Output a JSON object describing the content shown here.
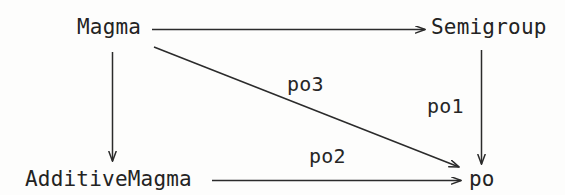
{
  "diagram": {
    "stroke_color": "#2b2b2b",
    "text_color": "#232323",
    "background_color": "#fdfdfc",
    "nodes": [
      {
        "id": "magma",
        "label": "Magma",
        "x": 77,
        "y": 17
      },
      {
        "id": "semigroup",
        "label": "Semigroup",
        "x": 431,
        "y": 17
      },
      {
        "id": "additivemagma",
        "label": "AdditiveMagma",
        "x": 25,
        "y": 169
      },
      {
        "id": "po",
        "label": "po",
        "x": 469,
        "y": 169
      }
    ],
    "edges": [
      {
        "id": "magma-to-semigroup",
        "from": "magma",
        "to": "semigroup",
        "label": "",
        "direction": "right"
      },
      {
        "id": "magma-to-additivemagma",
        "from": "magma",
        "to": "additivemagma",
        "label": "",
        "direction": "down"
      },
      {
        "id": "magma-to-po",
        "from": "magma",
        "to": "po",
        "label": "po3",
        "direction": "diagonal-down-right"
      },
      {
        "id": "semigroup-to-po",
        "from": "semigroup",
        "to": "po",
        "label": "po1",
        "direction": "down"
      },
      {
        "id": "additivemagma-to-po",
        "from": "additivemagma",
        "to": "po",
        "label": "po2",
        "direction": "right"
      }
    ],
    "edge_labels": {
      "po3": "po3",
      "po1": "po1",
      "po2": "po2"
    }
  }
}
